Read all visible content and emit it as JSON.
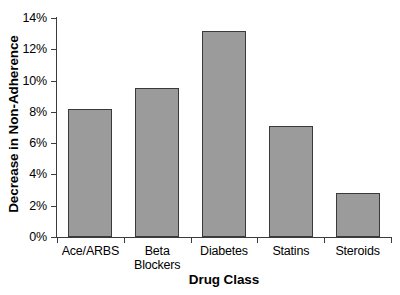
{
  "chart_data": {
    "type": "bar",
    "title": "",
    "xlabel": "Drug Class",
    "ylabel": "Decrease in Non-Adherence",
    "categories": [
      "Ace/ARBS",
      "Beta Blockers",
      "Diabetes",
      "Statins",
      "Steroids"
    ],
    "category_lines": [
      [
        "Ace/ARBS"
      ],
      [
        "Beta",
        "Blockers"
      ],
      [
        "Diabetes"
      ],
      [
        "Statins"
      ],
      [
        "Steroids"
      ]
    ],
    "values": [
      8.2,
      9.5,
      13.2,
      7.1,
      2.8
    ],
    "value_unit": "%",
    "ylim": [
      0,
      14
    ],
    "ytick_values": [
      0,
      2,
      4,
      6,
      8,
      10,
      12,
      14
    ],
    "ytick_labels": [
      "0%",
      "2%",
      "4%",
      "6%",
      "8%",
      "10%",
      "12%",
      "14%"
    ],
    "grid": false,
    "legend": false,
    "bar_fill_color": "#9b9b9b",
    "bar_edge_color": "#3a3a3a",
    "axis_color": "#3b3b3b",
    "background_color": "#ffffff"
  }
}
